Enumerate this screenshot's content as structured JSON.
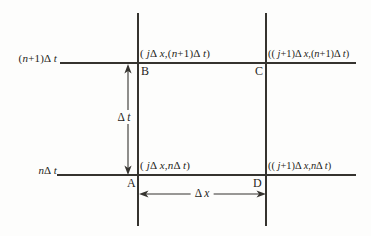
{
  "figure": {
    "type": "finite-difference-grid-cell",
    "colors": {
      "background": "#fdfdfc",
      "line": "#35332f",
      "text": "#1f1d1a"
    },
    "axis_labels": {
      "top": "(n+1)Δ t",
      "bottom": "nΔ t"
    },
    "points": {
      "B": {
        "letter": "B",
        "coords": "( jΔ x,(n+1)Δ t)"
      },
      "C": {
        "letter": "C",
        "coords": "(( j+1)Δ x,(n+1)Δ t)"
      },
      "A": {
        "letter": "A",
        "coords": "( jΔ x,nΔ t)"
      },
      "D": {
        "letter": "D",
        "coords": "(( j+1)Δ x,nΔ t)"
      }
    },
    "dimensions": {
      "vertical": "Δ t",
      "horizontal": "Δ x"
    }
  }
}
